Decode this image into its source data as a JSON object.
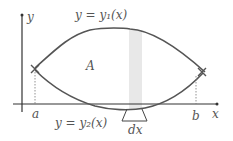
{
  "diagram": {
    "labels": {
      "y_axis": "y",
      "x_axis": "x",
      "upper_curve": "y = y₁(x)",
      "lower_curve": "y = y₂(x)",
      "region": "A",
      "a": "a",
      "b": "b",
      "dx": "dx"
    },
    "colors": {
      "curve": "#555555",
      "axis": "#333333",
      "strip": "#e6e6e6"
    }
  }
}
